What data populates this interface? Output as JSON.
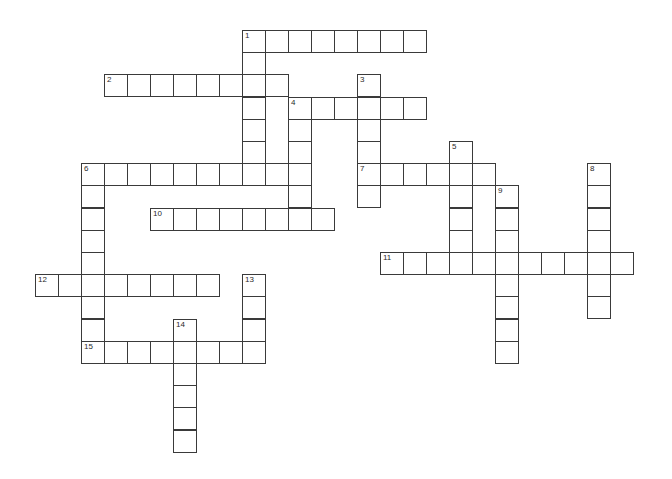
{
  "puzzle": {
    "type": "crossword",
    "layout": {
      "origin_x": 35,
      "origin_y": 30,
      "cell_w": 23,
      "cell_h": 22.2
    },
    "colors": {
      "line": "#3a3a3a",
      "background": "#ffffff",
      "number": "#2a2a2a"
    },
    "entries": [
      {
        "number": "1",
        "direction": "across",
        "col": 9,
        "row": 0,
        "length": 8
      },
      {
        "number": "1",
        "direction": "down",
        "col": 9,
        "row": 0,
        "length": 7
      },
      {
        "number": "2",
        "direction": "across",
        "col": 3,
        "row": 2,
        "length": 8
      },
      {
        "number": "3",
        "direction": "down",
        "col": 14,
        "row": 2,
        "length": 6
      },
      {
        "number": "4",
        "direction": "across",
        "col": 11,
        "row": 3,
        "length": 6
      },
      {
        "number": "4",
        "direction": "down",
        "col": 11,
        "row": 3,
        "length": 6
      },
      {
        "number": "5",
        "direction": "down",
        "col": 18,
        "row": 5,
        "length": 6
      },
      {
        "number": "6",
        "direction": "across",
        "col": 2,
        "row": 6,
        "length": 10
      },
      {
        "number": "6",
        "direction": "down",
        "col": 2,
        "row": 6,
        "length": 9
      },
      {
        "number": "7",
        "direction": "across",
        "col": 14,
        "row": 6,
        "length": 6
      },
      {
        "number": "8",
        "direction": "down",
        "col": 24,
        "row": 6,
        "length": 7
      },
      {
        "number": "9",
        "direction": "down",
        "col": 20,
        "row": 7,
        "length": 8
      },
      {
        "number": "10",
        "direction": "across",
        "col": 5,
        "row": 8,
        "length": 8
      },
      {
        "number": "11",
        "direction": "across",
        "col": 15,
        "row": 10,
        "length": 11
      },
      {
        "number": "12",
        "direction": "across",
        "col": 0,
        "row": 11,
        "length": 8
      },
      {
        "number": "13",
        "direction": "down",
        "col": 9,
        "row": 11,
        "length": 4
      },
      {
        "number": "14",
        "direction": "down",
        "col": 6,
        "row": 13,
        "length": 6
      },
      {
        "number": "15",
        "direction": "across",
        "col": 2,
        "row": 14,
        "length": 8
      }
    ]
  }
}
